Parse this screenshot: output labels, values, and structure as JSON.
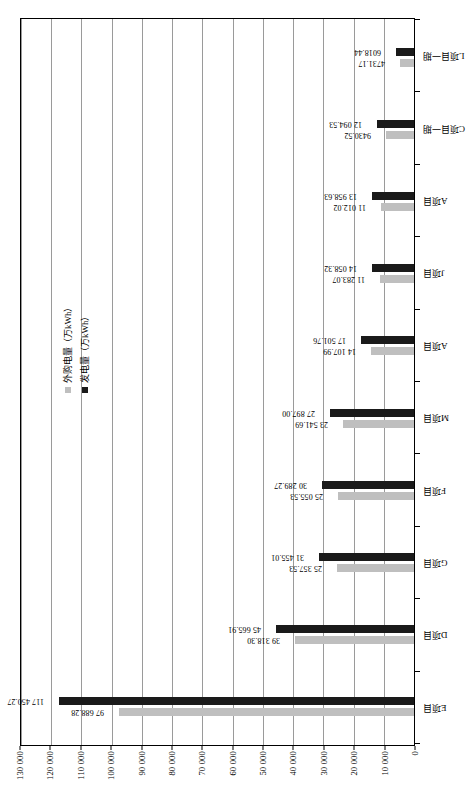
{
  "chart_data": {
    "type": "bar",
    "title": "",
    "xlabel": "",
    "ylabel": "",
    "ylim": [
      0,
      130000
    ],
    "ytick_step": 10000,
    "grid": true,
    "legend_position": "top-right-inside",
    "orientation": "vertical-bars-page-rotated-90",
    "categories": [
      "E项目",
      "D项目",
      "G项目",
      "F项目",
      "M项目",
      "A项目",
      "J项目",
      "A项目",
      "C项目一期",
      "L项目一期"
    ],
    "yticks": [
      "0",
      "10 000",
      "20 000",
      "30 000",
      "40 000",
      "50 000",
      "60 000",
      "70 000",
      "80 000",
      "90 000",
      "100 000",
      "110 000",
      "120 000",
      "130 000"
    ],
    "series": [
      {
        "name": "外购电量（万kWh）",
        "color": "#bfbfbf",
        "values": [
          97688.28,
          39318.3,
          25357.53,
          25055.53,
          23541.69,
          14107.99,
          11283.07,
          11012.02,
          9430.52,
          4731.17
        ],
        "labels": [
          "97 688.28",
          "39 318.30",
          "25 357.53",
          "25 055.53",
          "23 541.69",
          "14 107.99",
          "11 283.07",
          "11 012.02",
          "9430.52",
          "4731.17"
        ]
      },
      {
        "name": "发电量（万kWh）",
        "color": "#1a1a1a",
        "values": [
          117450.27,
          45665.91,
          31455.01,
          30289.27,
          27897.0,
          17501.76,
          14058.32,
          13958.63,
          12094.53,
          6018.44
        ],
        "labels": [
          "117 450.27",
          "45 665.91",
          "31 455.01",
          "30 289.27",
          "27 897.00",
          "17 501.76",
          "14 058.32",
          "13 958.63",
          "12 094.53",
          "6018.44"
        ]
      }
    ]
  },
  "legend": {
    "items": [
      {
        "label": "外购电量（万kWh）",
        "color": "#bfbfbf"
      },
      {
        "label": "发电量（万kWh）",
        "color": "#1a1a1a"
      }
    ]
  }
}
